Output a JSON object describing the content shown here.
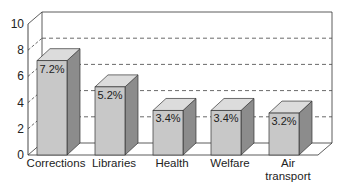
{
  "chart_data": {
    "type": "bar",
    "style": "3d",
    "title": "",
    "xlabel": "",
    "ylabel": "",
    "categories": [
      "Corrections",
      "Libraries",
      "Health",
      "Welfare",
      "Air transport"
    ],
    "category_lines": [
      [
        "Corrections"
      ],
      [
        "Libraries"
      ],
      [
        "Health"
      ],
      [
        "Welfare"
      ],
      [
        "Air",
        "transport"
      ]
    ],
    "values": [
      7.2,
      5.2,
      3.4,
      3.4,
      3.2
    ],
    "data_labels": [
      "7.2%",
      "5.2%",
      "3.4%",
      "3.4%",
      "3.2%"
    ],
    "ylim": [
      0,
      10
    ],
    "yticks": [
      0,
      2,
      4,
      6,
      8,
      10
    ],
    "ytick_labels": [
      "0",
      "2",
      "4",
      "6",
      "8",
      "10"
    ],
    "grid": {
      "on": true,
      "style": "dashed",
      "values": [
        2,
        4,
        6,
        8
      ]
    },
    "legend": null,
    "colors": {
      "bar_front": "#c8c8c8",
      "bar_top": "#dcdcdc",
      "bar_side": "#8c8c8c",
      "axis": "#333333",
      "grid": "#444444"
    }
  }
}
